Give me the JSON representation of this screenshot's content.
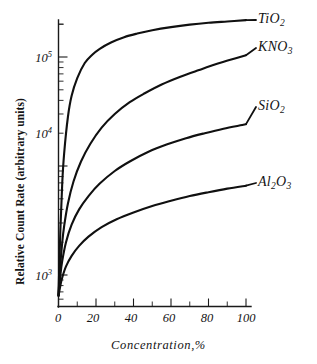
{
  "chart_data": {
    "type": "line",
    "title": "",
    "xlabel": "Concentration,%",
    "ylabel": "Relative Count Rate (arbitrary units)",
    "xlim": [
      0,
      105
    ],
    "ylim": [
      600,
      260000
    ],
    "yscale": "log",
    "xscale": "linear",
    "grid": false,
    "legend_position": "right-of-curve-endpoints",
    "x_ticks": [
      {
        "value": 0,
        "label": "0"
      },
      {
        "value": 10,
        "label": ""
      },
      {
        "value": 20,
        "label": "20"
      },
      {
        "value": 30,
        "label": ""
      },
      {
        "value": 40,
        "label": "40"
      },
      {
        "value": 50,
        "label": ""
      },
      {
        "value": 60,
        "label": "60"
      },
      {
        "value": 70,
        "label": ""
      },
      {
        "value": 80,
        "label": "80"
      },
      {
        "value": 90,
        "label": ""
      },
      {
        "value": 100,
        "label": "100"
      }
    ],
    "y_ticks": [
      {
        "value": 1000,
        "label": "10",
        "exponent": "3"
      },
      {
        "value": 10000,
        "label": "10",
        "exponent": "4"
      },
      {
        "value": 100000,
        "label": "10",
        "exponent": "5"
      }
    ],
    "series": [
      {
        "name": "TiO2",
        "label_html": "TiO<sub>2</sub>",
        "label_main": "TiO",
        "label_sub": "2",
        "color": "#101010",
        "x": [
          0,
          1,
          2,
          3,
          5,
          7,
          10,
          14,
          18,
          22,
          28,
          35,
          42,
          50,
          60,
          70,
          80,
          90,
          100
        ],
        "y": [
          650,
          2600,
          7000,
          13000,
          28000,
          44000,
          64000,
          88000,
          105000,
          119000,
          136000,
          152000,
          164000,
          176000,
          188000,
          198000,
          206000,
          212000,
          218000
        ]
      },
      {
        "name": "KNO3",
        "label_html": "KNO<sub>3</sub>",
        "label_main": "KNO",
        "label_sub": "3",
        "color": "#101010",
        "x": [
          0,
          1,
          2,
          3,
          5,
          8,
          12,
          17,
          23,
          30,
          38,
          46,
          55,
          65,
          75,
          85,
          95,
          100
        ],
        "y": [
          650,
          1250,
          2000,
          2800,
          4500,
          7200,
          11000,
          16000,
          22500,
          30000,
          38500,
          46500,
          56000,
          66000,
          76000,
          87000,
          98000,
          104000
        ]
      },
      {
        "name": "SiO2",
        "label_html": "SiO<sub>2</sub>",
        "label_main": "SiO",
        "label_sub": "2",
        "color": "#101010",
        "x": [
          0,
          1,
          2,
          4,
          7,
          11,
          16,
          22,
          30,
          38,
          48,
          58,
          68,
          78,
          88,
          98,
          100
        ],
        "y": [
          650,
          1000,
          1350,
          2000,
          2900,
          4000,
          5300,
          6900,
          9000,
          11000,
          13500,
          15800,
          18000,
          20000,
          22000,
          23800,
          24200
        ]
      },
      {
        "name": "Al2O3",
        "label_html": "Al<sub>2</sub>O<sub>3</sub>",
        "label_main": "Al",
        "label_sub": "2",
        "label_main2": "O",
        "label_sub2": "3",
        "color": "#101010",
        "x": [
          0,
          1,
          2,
          4,
          7,
          11,
          16,
          23,
          31,
          40,
          50,
          60,
          70,
          80,
          90,
          100
        ],
        "y": [
          640,
          800,
          950,
          1200,
          1500,
          1850,
          2250,
          2750,
          3250,
          3750,
          4300,
          4800,
          5300,
          5750,
          6200,
          6600
        ]
      }
    ],
    "annotations": [
      {
        "name": "TiO2",
        "text": "TiO2"
      },
      {
        "name": "KNO3",
        "text": "KNO3"
      },
      {
        "name": "SiO2",
        "text": "SiO2"
      },
      {
        "name": "Al2O3",
        "text": "Al2O3"
      }
    ]
  },
  "axis_titles": {
    "x": "Concentration,%",
    "y": "Relative Count Rate (arbitrary units)"
  },
  "xtick_labels": {
    "t0": "0",
    "t20": "20",
    "t40": "40",
    "t60": "60",
    "t80": "80",
    "t100": "100"
  },
  "ytick_labels": {
    "e3_mantissa": "10",
    "e3_exp": "3",
    "e4_mantissa": "10",
    "e4_exp": "4",
    "e5_mantissa": "10",
    "e5_exp": "5"
  },
  "series_labels": {
    "tio2_main": "TiO",
    "tio2_sub": "2",
    "kno3_main": "KNO",
    "kno3_sub": "3",
    "sio2_main": "SiO",
    "sio2_sub": "2",
    "al2o3_main": "Al",
    "al2o3_sub1": "2",
    "al2o3_main2": "O",
    "al2o3_sub2": "3"
  },
  "colors": {
    "curve": "#101010",
    "axis": "#1a1a1a",
    "background": "#ffffff"
  }
}
